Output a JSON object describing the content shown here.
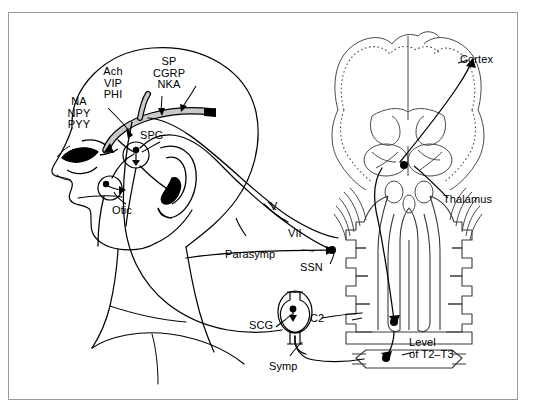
{
  "figure": {
    "type": "anatomical-diagram",
    "frame_color": "#9a9a9a",
    "line_color": "#000000",
    "brain_outline_color": "#3a3a3a"
  },
  "labels": {
    "sympathetic_transmitters": "NA\nNPY\nPYY",
    "parasympathetic_transmitters": "Ach\nVIP\nPHI",
    "sensory_transmitters": "SP\nCGRP\nNKA",
    "spg": "SPG",
    "otic": "Otic",
    "parasymp": "Parasymp",
    "symp": "Symp",
    "scg": "SCG",
    "ssn": "SSN",
    "nerve_v": "V",
    "nerve_vii": "VII",
    "c2": "C2",
    "level_t2_t3": "Level\nof T2–T3",
    "cortex": "Cortex",
    "thalamus": "Thalamus"
  },
  "structures": {
    "head_profile": "lateral-head-profile",
    "eye": "eye",
    "ear": "ear",
    "brain_coronal": "coronal-brain-section",
    "brainstem": "brainstem",
    "cerebellum": "cerebellum",
    "spinal_cord": "spinal-cord",
    "vertebral_segments": "vertebral-segments",
    "spg_ganglion": "sphenopalatine-ganglion",
    "otic_ganglion": "otic-ganglion",
    "scg_ganglion": "superior-cervical-ganglion",
    "vessel": "cranial-blood-vessel"
  }
}
